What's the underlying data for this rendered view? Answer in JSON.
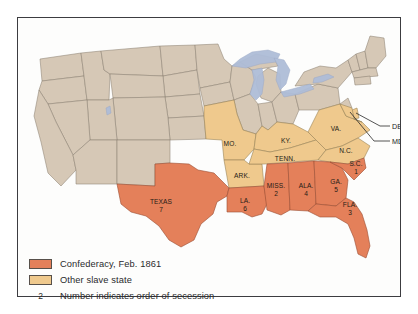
{
  "figure": {
    "background_color": "#ffffff",
    "frame_color": "#3c3c40"
  },
  "colors": {
    "confederacy": "#e4805a",
    "other_slave_state": "#efc98d",
    "free_state": "#d6c8b6",
    "water": "#aebdd8",
    "border": "#8d8274",
    "coastline": "#6f665c",
    "text": "#241c16"
  },
  "legend": {
    "items": [
      {
        "key": "confederacy",
        "swatch_color": "#e4805a",
        "label": "Confederacy, Feb. 1861"
      },
      {
        "key": "other_slave_state",
        "swatch_color": "#efc98d",
        "label": "Other slave state"
      },
      {
        "key": "order_note",
        "number": "2",
        "label": "Number indicates order of secession"
      }
    ]
  },
  "map": {
    "confederate_states": [
      {
        "abbr": "TEXAS",
        "order": "7",
        "x": 143,
        "y": 186
      },
      {
        "abbr": "LA.",
        "order": "6",
        "x": 227,
        "y": 185
      },
      {
        "abbr": "MISS.",
        "order": "2",
        "x": 258,
        "y": 170
      },
      {
        "abbr": "ALA.",
        "order": "4",
        "x": 288,
        "y": 170
      },
      {
        "abbr": "GA.",
        "order": "5",
        "x": 318,
        "y": 166
      },
      {
        "abbr": "S.C.",
        "order": "1",
        "x": 337,
        "y": 148
      },
      {
        "abbr": "FLA.",
        "order": "3",
        "x": 332,
        "y": 189
      }
    ],
    "other_slave_states": [
      {
        "abbr": "MO.",
        "x": 234,
        "y": 128
      },
      {
        "abbr": "ARK.",
        "x": 233,
        "y": 158
      },
      {
        "abbr": "KY.",
        "x": 281,
        "y": 127
      },
      {
        "abbr": "TENN.",
        "x": 285,
        "y": 146
      },
      {
        "abbr": "VA.",
        "x": 325,
        "y": 116
      },
      {
        "abbr": "N.C.",
        "x": 337,
        "y": 136
      }
    ],
    "callouts": [
      {
        "abbr": "DEL.",
        "x": 377,
        "y": 113
      },
      {
        "abbr": "MD.",
        "x": 377,
        "y": 128
      }
    ]
  }
}
